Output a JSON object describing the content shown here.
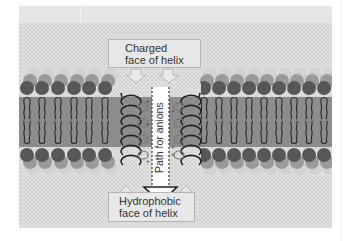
{
  "figure": {
    "labels": {
      "charged_line1": "Charged",
      "charged_line2": "face of helix",
      "hydrophobic_line1": "Hydrophobic",
      "hydrophobic_line2": "face of helix",
      "path": "Path for anions"
    },
    "charge_marks": [
      "+",
      "+",
      "+",
      "+",
      "+",
      "+"
    ],
    "colors": {
      "background_stipple": "#d9d9d9",
      "membrane_core": "#8c8c8c",
      "head_dark": "#575757",
      "head_mid": "#8a8a8a",
      "head_light": "#c4c4c4",
      "label_box": "#e8e8e8",
      "path": "#ffffff"
    },
    "lipid_columns": {
      "left": 6,
      "right": 9
    }
  }
}
